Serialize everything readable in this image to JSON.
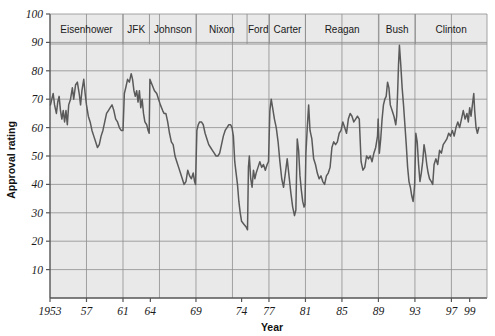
{
  "chart_data": {
    "type": "line",
    "title": "",
    "xlabel": "Year",
    "ylabel": "Approval rating",
    "xlim": [
      1953,
      2000.9
    ],
    "ylim": [
      0,
      100
    ],
    "grid": true,
    "legend_position": "none",
    "y_ticks": [
      10,
      20,
      30,
      40,
      50,
      60,
      70,
      80,
      90,
      100
    ],
    "y_tick_labels": [
      "10",
      "20",
      "30",
      "40",
      "50",
      "60",
      "70",
      "80",
      "90",
      "100"
    ],
    "x_ticks": [
      1953,
      1957,
      1961,
      1964,
      1969,
      1974,
      1977,
      1981,
      1985,
      1989,
      1993,
      1997,
      1999
    ],
    "x_tick_labels": [
      "1953",
      "57",
      "61",
      "64",
      "69",
      "74",
      "77",
      "81",
      "85",
      "89",
      "93",
      "97",
      "99"
    ],
    "x_gridlines": [
      1957,
      1961,
      1965,
      1969,
      1973,
      1977,
      1981,
      1985,
      1989,
      1993,
      1997
    ],
    "series": [
      {
        "name": "Presidential approval rating",
        "color": "#5a5a5a",
        "points": [
          [
            1953.05,
            68
          ],
          [
            1953.2,
            70
          ],
          [
            1953.35,
            72
          ],
          [
            1953.5,
            68
          ],
          [
            1953.7,
            65
          ],
          [
            1953.85,
            69
          ],
          [
            1954.0,
            71
          ],
          [
            1954.15,
            66
          ],
          [
            1954.3,
            63
          ],
          [
            1954.45,
            66
          ],
          [
            1954.6,
            62
          ],
          [
            1954.75,
            66
          ],
          [
            1954.9,
            61
          ],
          [
            1955.05,
            68
          ],
          [
            1955.25,
            70
          ],
          [
            1955.45,
            74
          ],
          [
            1955.6,
            70
          ],
          [
            1955.8,
            75
          ],
          [
            1956.0,
            76
          ],
          [
            1956.2,
            72
          ],
          [
            1956.35,
            68
          ],
          [
            1956.5,
            73
          ],
          [
            1956.7,
            77
          ],
          [
            1956.85,
            72
          ],
          [
            1957.0,
            68
          ],
          [
            1957.2,
            64
          ],
          [
            1957.4,
            62
          ],
          [
            1957.6,
            59
          ],
          [
            1957.8,
            57
          ],
          [
            1958.0,
            55
          ],
          [
            1958.2,
            53
          ],
          [
            1958.4,
            54
          ],
          [
            1958.6,
            57
          ],
          [
            1958.8,
            59
          ],
          [
            1959.0,
            62
          ],
          [
            1959.2,
            65
          ],
          [
            1959.4,
            66
          ],
          [
            1959.6,
            67
          ],
          [
            1959.8,
            68
          ],
          [
            1960.0,
            66
          ],
          [
            1960.2,
            63
          ],
          [
            1960.4,
            62
          ],
          [
            1960.6,
            60
          ],
          [
            1960.8,
            59
          ],
          [
            1961.0,
            59
          ],
          [
            1961.15,
            72
          ],
          [
            1961.3,
            74
          ],
          [
            1961.5,
            77
          ],
          [
            1961.7,
            76
          ],
          [
            1961.9,
            79
          ],
          [
            1962.05,
            77
          ],
          [
            1962.2,
            73
          ],
          [
            1962.35,
            71
          ],
          [
            1962.5,
            73
          ],
          [
            1962.65,
            69
          ],
          [
            1962.8,
            73
          ],
          [
            1962.95,
            67
          ],
          [
            1963.1,
            70
          ],
          [
            1963.25,
            65
          ],
          [
            1963.4,
            62
          ],
          [
            1963.6,
            61
          ],
          [
            1963.75,
            59
          ],
          [
            1963.87,
            58
          ],
          [
            1963.95,
            77
          ],
          [
            1964.2,
            75
          ],
          [
            1964.45,
            73
          ],
          [
            1964.7,
            72
          ],
          [
            1964.9,
            70
          ],
          [
            1965.1,
            68
          ],
          [
            1965.35,
            66
          ],
          [
            1965.5,
            65
          ],
          [
            1965.7,
            65
          ],
          [
            1965.9,
            62
          ],
          [
            1966.1,
            58
          ],
          [
            1966.3,
            55
          ],
          [
            1966.5,
            54
          ],
          [
            1966.7,
            50
          ],
          [
            1966.9,
            48
          ],
          [
            1967.1,
            46
          ],
          [
            1967.3,
            44
          ],
          [
            1967.5,
            42
          ],
          [
            1967.7,
            40
          ],
          [
            1967.9,
            41
          ],
          [
            1968.1,
            45
          ],
          [
            1968.3,
            43
          ],
          [
            1968.5,
            42
          ],
          [
            1968.7,
            44
          ],
          [
            1968.85,
            41
          ],
          [
            1968.95,
            40
          ],
          [
            1969.1,
            59
          ],
          [
            1969.25,
            61
          ],
          [
            1969.4,
            62
          ],
          [
            1969.6,
            62
          ],
          [
            1969.8,
            61
          ],
          [
            1970.0,
            58
          ],
          [
            1970.2,
            56
          ],
          [
            1970.4,
            54
          ],
          [
            1970.6,
            53
          ],
          [
            1970.8,
            52
          ],
          [
            1971.0,
            51
          ],
          [
            1971.2,
            50
          ],
          [
            1971.4,
            50
          ],
          [
            1971.6,
            51
          ],
          [
            1971.8,
            54
          ],
          [
            1972.0,
            57
          ],
          [
            1972.2,
            59
          ],
          [
            1972.4,
            60
          ],
          [
            1972.6,
            61
          ],
          [
            1972.8,
            61
          ],
          [
            1972.95,
            60
          ],
          [
            1973.1,
            57
          ],
          [
            1973.25,
            48
          ],
          [
            1973.4,
            44
          ],
          [
            1973.55,
            40
          ],
          [
            1973.7,
            34
          ],
          [
            1973.85,
            30
          ],
          [
            1974.0,
            27
          ],
          [
            1974.25,
            26
          ],
          [
            1974.5,
            25
          ],
          [
            1974.65,
            24
          ],
          [
            1974.75,
            46
          ],
          [
            1974.85,
            50
          ],
          [
            1975.0,
            42
          ],
          [
            1975.15,
            39
          ],
          [
            1975.3,
            45
          ],
          [
            1975.45,
            42
          ],
          [
            1975.6,
            44
          ],
          [
            1975.8,
            46
          ],
          [
            1976.0,
            48
          ],
          [
            1976.2,
            46
          ],
          [
            1976.4,
            47
          ],
          [
            1976.6,
            45
          ],
          [
            1976.8,
            47
          ],
          [
            1976.95,
            48
          ],
          [
            1977.1,
            66
          ],
          [
            1977.25,
            70
          ],
          [
            1977.4,
            67
          ],
          [
            1977.6,
            63
          ],
          [
            1977.8,
            60
          ],
          [
            1978.0,
            55
          ],
          [
            1978.2,
            48
          ],
          [
            1978.4,
            42
          ],
          [
            1978.6,
            39
          ],
          [
            1978.8,
            44
          ],
          [
            1979.0,
            49
          ],
          [
            1979.2,
            43
          ],
          [
            1979.4,
            37
          ],
          [
            1979.6,
            32
          ],
          [
            1979.8,
            29
          ],
          [
            1979.95,
            31
          ],
          [
            1980.1,
            56
          ],
          [
            1980.25,
            52
          ],
          [
            1980.4,
            43
          ],
          [
            1980.55,
            38
          ],
          [
            1980.7,
            34
          ],
          [
            1980.85,
            32
          ],
          [
            1980.95,
            33
          ],
          [
            1981.05,
            51
          ],
          [
            1981.2,
            60
          ],
          [
            1981.35,
            68
          ],
          [
            1981.5,
            59
          ],
          [
            1981.7,
            56
          ],
          [
            1981.9,
            49
          ],
          [
            1982.1,
            47
          ],
          [
            1982.3,
            44
          ],
          [
            1982.5,
            42
          ],
          [
            1982.7,
            43
          ],
          [
            1982.9,
            41
          ],
          [
            1983.1,
            40
          ],
          [
            1983.3,
            43
          ],
          [
            1983.5,
            44
          ],
          [
            1983.7,
            46
          ],
          [
            1983.9,
            53
          ],
          [
            1984.1,
            55
          ],
          [
            1984.3,
            54
          ],
          [
            1984.5,
            55
          ],
          [
            1984.7,
            58
          ],
          [
            1984.9,
            59
          ],
          [
            1985.1,
            62
          ],
          [
            1985.3,
            60
          ],
          [
            1985.5,
            58
          ],
          [
            1985.7,
            63
          ],
          [
            1985.9,
            65
          ],
          [
            1986.1,
            64
          ],
          [
            1986.3,
            62
          ],
          [
            1986.5,
            63
          ],
          [
            1986.7,
            64
          ],
          [
            1986.9,
            63
          ],
          [
            1987.1,
            48
          ],
          [
            1987.3,
            45
          ],
          [
            1987.5,
            46
          ],
          [
            1987.7,
            50
          ],
          [
            1987.9,
            49
          ],
          [
            1988.1,
            50
          ],
          [
            1988.3,
            48
          ],
          [
            1988.5,
            51
          ],
          [
            1988.7,
            53
          ],
          [
            1988.9,
            57
          ],
          [
            1988.97,
            63
          ],
          [
            1989.1,
            51
          ],
          [
            1989.25,
            56
          ],
          [
            1989.4,
            63
          ],
          [
            1989.55,
            68
          ],
          [
            1989.7,
            70
          ],
          [
            1989.85,
            71
          ],
          [
            1990.0,
            76
          ],
          [
            1990.15,
            74
          ],
          [
            1990.3,
            68
          ],
          [
            1990.5,
            66
          ],
          [
            1990.7,
            64
          ],
          [
            1990.9,
            61
          ],
          [
            1991.0,
            64
          ],
          [
            1991.1,
            72
          ],
          [
            1991.2,
            82
          ],
          [
            1991.3,
            89
          ],
          [
            1991.45,
            82
          ],
          [
            1991.6,
            74
          ],
          [
            1991.75,
            68
          ],
          [
            1991.9,
            61
          ],
          [
            1992.05,
            54
          ],
          [
            1992.2,
            46
          ],
          [
            1992.35,
            41
          ],
          [
            1992.5,
            39
          ],
          [
            1992.65,
            36
          ],
          [
            1992.8,
            34
          ],
          [
            1992.9,
            37
          ],
          [
            1992.97,
            40
          ],
          [
            1993.1,
            58
          ],
          [
            1993.25,
            55
          ],
          [
            1993.4,
            47
          ],
          [
            1993.55,
            41
          ],
          [
            1993.7,
            44
          ],
          [
            1993.85,
            48
          ],
          [
            1994.0,
            54
          ],
          [
            1994.15,
            51
          ],
          [
            1994.3,
            47
          ],
          [
            1994.45,
            44
          ],
          [
            1994.6,
            42
          ],
          [
            1994.8,
            41
          ],
          [
            1994.95,
            40
          ],
          [
            1995.1,
            47
          ],
          [
            1995.3,
            49
          ],
          [
            1995.5,
            47
          ],
          [
            1995.7,
            52
          ],
          [
            1995.9,
            51
          ],
          [
            1996.1,
            54
          ],
          [
            1996.3,
            55
          ],
          [
            1996.5,
            56
          ],
          [
            1996.7,
            58
          ],
          [
            1996.9,
            57
          ],
          [
            1997.1,
            59
          ],
          [
            1997.3,
            57
          ],
          [
            1997.5,
            60
          ],
          [
            1997.7,
            62
          ],
          [
            1997.9,
            60
          ],
          [
            1998.1,
            63
          ],
          [
            1998.3,
            66
          ],
          [
            1998.5,
            63
          ],
          [
            1998.7,
            65
          ],
          [
            1998.85,
            62
          ],
          [
            1999.0,
            67
          ],
          [
            1999.15,
            64
          ],
          [
            1999.3,
            68
          ],
          [
            1999.45,
            72
          ],
          [
            1999.55,
            66
          ],
          [
            1999.7,
            60
          ],
          [
            1999.85,
            58
          ],
          [
            2000.0,
            60
          ]
        ]
      }
    ],
    "president_bands": [
      {
        "label": "Eisenhower",
        "start": 1953.0,
        "end": 1961.0
      },
      {
        "label": "JFK",
        "start": 1961.0,
        "end": 1963.9
      },
      {
        "label": "Johnson",
        "start": 1963.9,
        "end": 1969.05
      },
      {
        "label": "Nixon",
        "start": 1969.05,
        "end": 1974.6
      },
      {
        "label": "Ford",
        "start": 1974.6,
        "end": 1977.05
      },
      {
        "label": "Carter",
        "start": 1977.05,
        "end": 1981.0
      },
      {
        "label": "Reagan",
        "start": 1981.0,
        "end": 1989.05
      },
      {
        "label": "Bush",
        "start": 1989.05,
        "end": 1993.05
      },
      {
        "label": "Clinton",
        "start": 1993.05,
        "end": 2000.9
      }
    ],
    "colors": {
      "line": "#5a5a5a",
      "plot_background": "#e9e9e9",
      "grid": "#8e8e8e",
      "axis": "#555555",
      "text": "#1a1a1a"
    }
  }
}
